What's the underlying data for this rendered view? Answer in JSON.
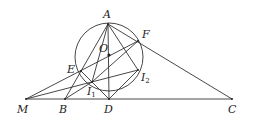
{
  "diagram": {
    "type": "geometry",
    "stroke_color": "#333333",
    "circle": {
      "name": "circle-O",
      "cx": 109,
      "cy": 57,
      "r": 34
    },
    "points": {
      "A": {
        "x": 108,
        "y": 24,
        "label": "A",
        "lx": 103,
        "ly": 18
      },
      "F": {
        "x": 138,
        "y": 41,
        "label": "F",
        "lx": 142,
        "ly": 38
      },
      "O": {
        "x": 109,
        "y": 55,
        "label": "O",
        "lx": 99,
        "ly": 52
      },
      "E": {
        "x": 81,
        "y": 71,
        "label": "E",
        "lx": 67,
        "ly": 73
      },
      "I2": {
        "x": 138,
        "y": 70,
        "label": "I",
        "sub": "2",
        "lx": 141,
        "ly": 81
      },
      "I1": {
        "x": 92,
        "y": 82,
        "label": "I",
        "sub": "1",
        "lx": 87,
        "ly": 95
      },
      "D": {
        "x": 109,
        "y": 99,
        "label": "D",
        "lx": 104,
        "ly": 113
      },
      "M": {
        "x": 26,
        "y": 99,
        "label": "M",
        "lx": 17,
        "ly": 113
      },
      "B": {
        "x": 65,
        "y": 99,
        "label": "B",
        "lx": 59,
        "ly": 113
      },
      "C": {
        "x": 232,
        "y": 99,
        "label": "C",
        "lx": 228,
        "ly": 113
      }
    },
    "segments": [
      [
        "M",
        "C"
      ],
      [
        "A",
        "B"
      ],
      [
        "A",
        "C"
      ],
      [
        "A",
        "D"
      ],
      [
        "M",
        "F"
      ],
      [
        "M",
        "I2"
      ],
      [
        "A",
        "I1"
      ],
      [
        "A",
        "I2"
      ],
      [
        "B",
        "I1"
      ],
      [
        "I1",
        "D"
      ],
      [
        "D",
        "I2"
      ],
      [
        "E",
        "I1"
      ],
      [
        "I1",
        "F"
      ]
    ]
  }
}
